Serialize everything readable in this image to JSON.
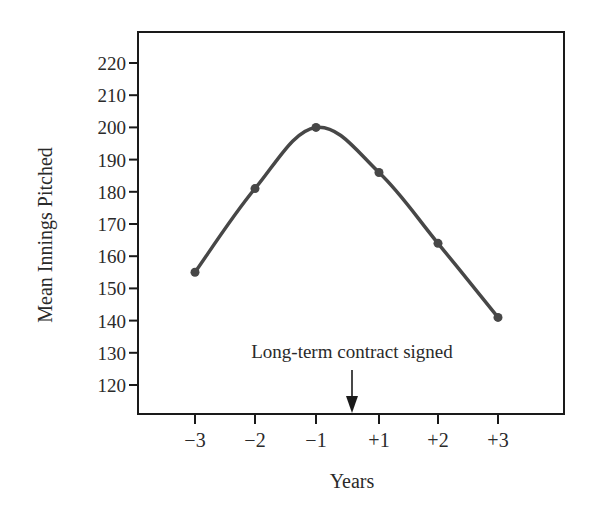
{
  "chart_data": {
    "type": "line",
    "title": "",
    "xlabel": "Years",
    "ylabel": "Mean Innings Pitched",
    "categories": [
      "−3",
      "−2",
      "−1",
      "+1",
      "+2",
      "+3"
    ],
    "x": [
      -3,
      -2,
      -1,
      1,
      2,
      3
    ],
    "series": [
      {
        "name": "Mean Innings Pitched",
        "values": [
          155,
          181,
          200,
          186,
          164,
          141
        ]
      }
    ],
    "ylim": [
      110,
      230
    ],
    "yticks": [
      120,
      130,
      140,
      150,
      160,
      170,
      180,
      190,
      200,
      210,
      220
    ],
    "ytick_labels": [
      "120",
      "130",
      "140",
      "150",
      "160",
      "170",
      "180",
      "190",
      "200",
      "210",
      "220"
    ],
    "grid": false,
    "legend": "none",
    "annotations": [
      {
        "text": "Long-term contract signed",
        "x_between": [
          "−1",
          "+1"
        ],
        "marker": "down-arrow"
      }
    ]
  },
  "labels": {
    "ylabel": "Mean Innings Pitched",
    "xlabel": "Years",
    "annotation": "Long-term contract signed"
  },
  "colors": {
    "line": "#474747",
    "axis": "#1a1a1a",
    "text": "#2a2a2a"
  }
}
